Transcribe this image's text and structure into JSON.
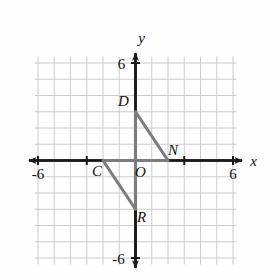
{
  "figure": {
    "title": "",
    "type": "coordinate-plane-geometry",
    "axes": {
      "x_label": "x",
      "y_label": "y",
      "x_min_label": "-6",
      "x_max_label": "6",
      "y_min_label": "-6",
      "y_max_label": "6",
      "x_range": [
        -6,
        6
      ],
      "y_range": [
        -6,
        6
      ],
      "grid": true,
      "grid_step": 1,
      "origin_label": "O"
    },
    "colors": {
      "grid": "#c9c4cc",
      "axis": "#1a1a1a",
      "shape_stroke": "#7b7b80",
      "label": "#111111",
      "background": "#fefefe"
    },
    "points": [
      {
        "name": "D",
        "label": "D",
        "x": 0,
        "y": 3,
        "label_dx": -12,
        "label_dy": -6
      },
      {
        "name": "N",
        "label": "N",
        "x": 2,
        "y": 0,
        "label_dx": 5,
        "label_dy": -6
      },
      {
        "name": "C",
        "label": "C",
        "x": -2,
        "y": 0,
        "label_dx": -6,
        "label_dy": 15
      },
      {
        "name": "R",
        "label": "R",
        "x": 0,
        "y": -3,
        "label_dx": 6,
        "label_dy": 13
      },
      {
        "name": "O",
        "label": "O",
        "x": 0,
        "y": 0,
        "label_dx": 5,
        "label_dy": 16
      }
    ],
    "shapes": [
      {
        "name": "figure-DON",
        "description": "Right angle path from D down the y-axis to the origin, then along the x-axis to N, closed by hypotenuse D to N",
        "vertices": [
          [
            0,
            3
          ],
          [
            0,
            0
          ],
          [
            2,
            0
          ]
        ],
        "hypotenuse": [
          [
            0,
            3
          ],
          [
            2,
            0
          ]
        ]
      },
      {
        "name": "figure-CORimage",
        "description": "Right angle path from C along the x-axis to the origin, then down the y-axis to R, closed by hypotenuse C to R",
        "vertices": [
          [
            -2,
            0
          ],
          [
            0,
            0
          ],
          [
            0,
            -3
          ]
        ],
        "hypotenuse": [
          [
            -2,
            0
          ],
          [
            0,
            -3
          ]
        ]
      }
    ],
    "x_ticks": [
      -6,
      -3,
      3,
      6
    ],
    "y_ticks": [
      -6,
      6
    ]
  }
}
